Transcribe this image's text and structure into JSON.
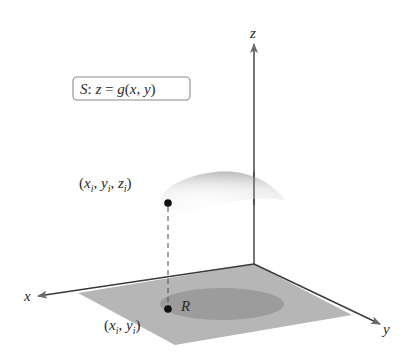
{
  "diagram": {
    "surface_label": {
      "prefix": "S",
      "sep": ": ",
      "eq_lhs": "z",
      "eq_sign": " = ",
      "func": "g",
      "open": "(",
      "arg1": "x",
      "comma": ", ",
      "arg2": "y",
      "close": ")"
    },
    "axes": {
      "x_label": "x",
      "y_label": "y",
      "z_label": "z"
    },
    "region_label": "R",
    "surface_point": {
      "open": "(",
      "x": "x",
      "y": "y",
      "z": "z",
      "sub": "i",
      "comma": ", ",
      "close": ")"
    },
    "plane_point": {
      "open": "(",
      "x": "x",
      "y": "y",
      "sub": "i",
      "comma": ", ",
      "close": ")"
    },
    "colors": {
      "axis": "#3a3a3a",
      "plane": "#b4b4b4",
      "region": "#9a9a9a",
      "surface_light": "#f4f4f4",
      "surface_dark": "#b8b8b8",
      "point": "#111111",
      "box_border": "#8a8a8a"
    }
  }
}
